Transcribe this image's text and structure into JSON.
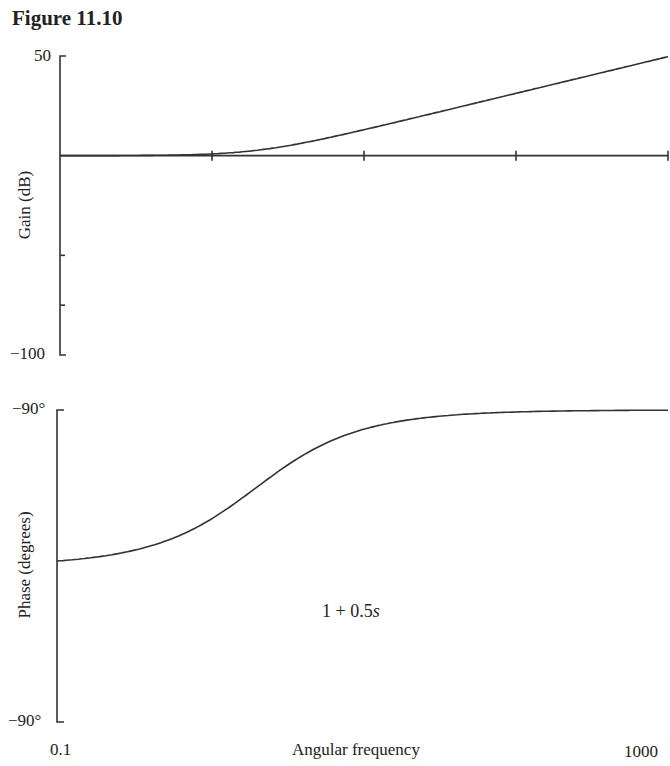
{
  "figure": {
    "title": "Figure 11.10"
  },
  "chart_data": [
    {
      "type": "line",
      "panel": "gain",
      "title": "",
      "xlabel": "",
      "ylabel": "Gain (dB)",
      "xscale": "log",
      "xlim": [
        0.1,
        1000
      ],
      "ylim": [
        -100,
        50
      ],
      "y_tick_labels": [
        "50",
        "-100"
      ],
      "x_ticks_on_zero_line": [
        1,
        10,
        100,
        1000
      ],
      "grid": false,
      "series": [
        {
          "name": "1 + 0.5s gain",
          "x": [
            0.1,
            0.3,
            1,
            2,
            3,
            10,
            30,
            100,
            300,
            1000
          ],
          "values": [
            0.01,
            0.1,
            0.97,
            3.0,
            5.1,
            14.2,
            23.5,
            34.0,
            43.5,
            54.0
          ]
        },
        {
          "name": "0 dB reference",
          "x": [
            0.1,
            1000
          ],
          "values": [
            0,
            0
          ]
        }
      ]
    },
    {
      "type": "line",
      "panel": "phase",
      "title": "",
      "xlabel": "Angular frequency",
      "ylabel": "Phase (degrees)",
      "xscale": "log",
      "xlim": [
        0.1,
        1000
      ],
      "ylim": [
        -90,
        90
      ],
      "y_tick_labels": [
        "-90°",
        "-90°"
      ],
      "x_tick_labels": [
        "0.1",
        "1000"
      ],
      "grid": false,
      "annotations": [
        "1 + 0.5s"
      ],
      "series": [
        {
          "name": "1 + 0.5s phase",
          "x": [
            0.1,
            0.3,
            1,
            2,
            3,
            10,
            30,
            100,
            300,
            1000
          ],
          "values": [
            2.9,
            8.5,
            26.6,
            45.0,
            56.3,
            78.7,
            86.2,
            88.9,
            89.6,
            89.9
          ]
        }
      ]
    }
  ],
  "labels": {
    "gain_ymax": "50",
    "gain_ymin": "−100",
    "gain_ylabel": "Gain (dB)",
    "phase_ymax": "−90°",
    "phase_ymin": "−90°",
    "phase_ylabel": "Phase (degrees)",
    "x_min": "0.1",
    "x_max": "1000",
    "xlabel": "Angular frequency",
    "annotation_prefix": "1 + 0.5",
    "annotation_var": "s"
  }
}
